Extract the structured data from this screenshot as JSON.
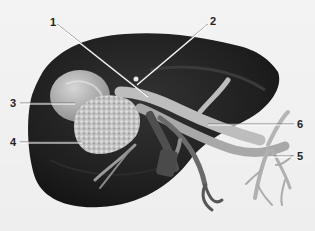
{
  "figure": {
    "colors": {
      "background": "#f1f1f1",
      "liver_dark": "#1c1c1c",
      "liver_mid": "#2e2e2e",
      "gallbladder": "#b8b8b8",
      "mass": "#c9c9c9",
      "vessel_light": "#c4c4c4",
      "vessel_dark": "#4a4a4a",
      "leader_line": "#ffffff"
    },
    "labels": [
      {
        "id": "1",
        "text": "1",
        "x": 50,
        "y": 17,
        "line": [
          57,
          24,
          148,
          96
        ]
      },
      {
        "id": "2",
        "text": "2",
        "x": 210,
        "y": 16,
        "line": [
          208,
          24,
          137,
          84
        ]
      },
      {
        "id": "3",
        "text": "3",
        "x": 10,
        "y": 98,
        "line": [
          20,
          103,
          75,
          103
        ]
      },
      {
        "id": "4",
        "text": "4",
        "x": 10,
        "y": 137,
        "line": [
          20,
          142,
          82,
          142
        ]
      },
      {
        "id": "6",
        "text": "6",
        "x": 297,
        "y": 119,
        "line": [
          294,
          124,
          208,
          124
        ]
      },
      {
        "id": "5",
        "text": "5",
        "x": 297,
        "y": 151,
        "line": [
          294,
          156,
          268,
          156
        ]
      }
    ]
  }
}
